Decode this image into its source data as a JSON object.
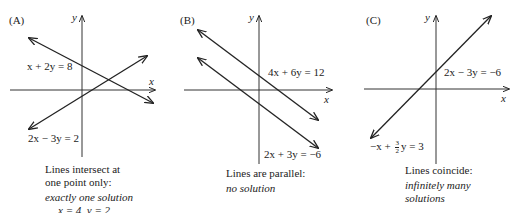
{
  "panels": [
    {
      "label": "(A)",
      "axes": {
        "x": "x",
        "y": "y"
      },
      "equations": [
        "x + 2y = 8",
        "2x − 3y = 2"
      ],
      "caption": {
        "line1": "Lines intersect at",
        "line2": "one point only:",
        "result": "exactly one solution",
        "solution": "x = 4, y = 2"
      }
    },
    {
      "label": "(B)",
      "axes": {
        "x": "x",
        "y": "y"
      },
      "equations": [
        "4x + 6y = 12",
        "2x + 3y = −6"
      ],
      "caption": {
        "line1": "Lines are parallel:",
        "result": "no solution"
      }
    },
    {
      "label": "(C)",
      "axes": {
        "x": "x",
        "y": "y"
      },
      "equations": [
        "2x − 3y = −6",
        "−x + ",
        "y = 3"
      ],
      "fraction": {
        "num": "3",
        "den": "2"
      },
      "caption": {
        "line1": "Lines coincide:",
        "result1": "infinitely many",
        "result2": "solutions"
      }
    }
  ]
}
